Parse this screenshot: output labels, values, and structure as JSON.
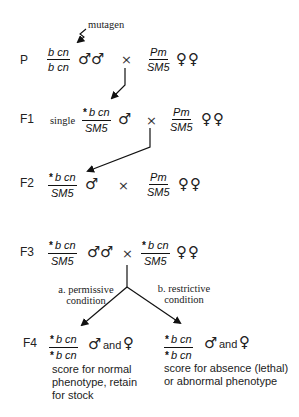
{
  "diagram": {
    "type": "genetic-crossing-scheme",
    "mutagen_label": "mutagen",
    "cross_symbol": "×",
    "male_symbol": "♂",
    "female_symbol": "♀",
    "and_label": "and",
    "generations": [
      {
        "label": "P",
        "male": {
          "numerator": "b cn",
          "denominator": "b cn",
          "count": 2
        },
        "female": {
          "numerator": "Pm",
          "denominator": "SM5",
          "count": 2
        }
      },
      {
        "label": "F1",
        "prefix": "single",
        "male": {
          "numerator": "b cn",
          "numerator_marker": "*",
          "denominator": "SM5",
          "count": 1
        },
        "female": {
          "numerator": "Pm",
          "denominator": "SM5",
          "count": 2
        }
      },
      {
        "label": "F2",
        "male": {
          "numerator": "b cn",
          "numerator_marker": "*",
          "denominator": "SM5",
          "count": 1
        },
        "female": {
          "numerator": "Pm",
          "denominator": "SM5",
          "count": 2
        }
      },
      {
        "label": "F3",
        "male": {
          "numerator": "b cn",
          "numerator_marker": "*",
          "denominator": "SM5",
          "count": 2
        },
        "female": {
          "numerator": "b cn",
          "numerator_marker": "*",
          "denominator": "SM5",
          "count": 2
        }
      },
      {
        "label": "F4",
        "outcomes": [
          {
            "condition": "a. permissive condition",
            "condition_line1": "a. permissive",
            "condition_line2": "condition",
            "numerator": "b cn",
            "numerator_marker": "*",
            "denominator": "b cn",
            "denominator_marker": "*",
            "description_lines": [
              "score for normal",
              "phenotype, retain",
              "for stock"
            ]
          },
          {
            "condition": "b. restrictive condition",
            "condition_line1": "b. restrictive",
            "condition_line2": "condition",
            "numerator": "b cn",
            "numerator_marker": "*",
            "denominator": "b cn",
            "denominator_marker": "*",
            "description_lines": [
              "score for absence (lethal)",
              "or abnormal phenotype"
            ]
          }
        ]
      }
    ]
  },
  "colors": {
    "ink": "#1a1a1a",
    "background": "#ffffff"
  }
}
